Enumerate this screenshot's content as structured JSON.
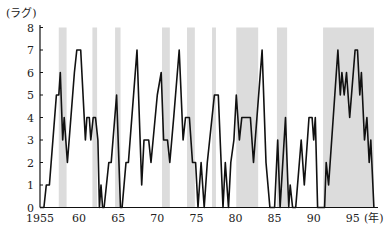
{
  "chart_data": {
    "type": "line",
    "title": "",
    "ylabel": "(ラグ)",
    "xlabel": "(年)",
    "xlim": [
      1955,
      1998.5
    ],
    "ylim": [
      0,
      8
    ],
    "grid": false,
    "legend": null,
    "x_ticks": [
      1955,
      1960,
      1965,
      1970,
      1975,
      1980,
      1985,
      1990,
      1995
    ],
    "x_tick_labels": [
      "1955",
      "60",
      "65",
      "70",
      "75",
      "80",
      "85",
      "90",
      "95"
    ],
    "y_ticks": [
      0,
      1,
      2,
      3,
      4,
      5,
      6,
      7,
      8
    ],
    "y_tick_labels": [
      "0",
      "1",
      "2",
      "3",
      "4",
      "5",
      "6",
      "7",
      "8"
    ],
    "shaded_periods": [
      [
        1957.4,
        1958.4
      ],
      [
        1961.7,
        1962.3
      ],
      [
        1964.6,
        1965.3
      ],
      [
        1970.6,
        1971.6
      ],
      [
        1973.8,
        1974.8
      ],
      [
        1977.0,
        1977.5
      ],
      [
        1980.1,
        1982.9
      ],
      [
        1985.3,
        1986.6
      ],
      [
        1991.2,
        1997.7
      ]
    ],
    "shade_color": "#dcdcdc",
    "line_color": "#111111",
    "series": [
      {
        "name": "lag",
        "points": [
          [
            1955.0,
            0
          ],
          [
            1955.5,
            0
          ],
          [
            1955.8,
            1
          ],
          [
            1956.2,
            1
          ],
          [
            1957.1,
            5
          ],
          [
            1957.4,
            5
          ],
          [
            1957.6,
            6
          ],
          [
            1957.9,
            3
          ],
          [
            1958.1,
            4
          ],
          [
            1958.5,
            2
          ],
          [
            1959.4,
            6
          ],
          [
            1959.7,
            7
          ],
          [
            1960.2,
            7
          ],
          [
            1960.8,
            3
          ],
          [
            1961.0,
            4
          ],
          [
            1961.3,
            4
          ],
          [
            1961.5,
            3
          ],
          [
            1961.8,
            4
          ],
          [
            1962.1,
            4
          ],
          [
            1962.4,
            3
          ],
          [
            1962.6,
            0
          ],
          [
            1962.8,
            1
          ],
          [
            1963.0,
            0
          ],
          [
            1963.2,
            0
          ],
          [
            1963.8,
            2
          ],
          [
            1964.1,
            2
          ],
          [
            1964.8,
            5
          ],
          [
            1965.3,
            0
          ],
          [
            1965.5,
            0
          ],
          [
            1966.0,
            2
          ],
          [
            1966.3,
            2
          ],
          [
            1967.4,
            7
          ],
          [
            1968.0,
            1
          ],
          [
            1968.3,
            3
          ],
          [
            1968.9,
            3
          ],
          [
            1969.2,
            2
          ],
          [
            1970.0,
            5
          ],
          [
            1970.5,
            6
          ],
          [
            1970.8,
            3
          ],
          [
            1971.3,
            3
          ],
          [
            1971.6,
            2
          ],
          [
            1972.1,
            4
          ],
          [
            1972.8,
            7
          ],
          [
            1973.3,
            3
          ],
          [
            1973.6,
            4
          ],
          [
            1974.1,
            4
          ],
          [
            1974.5,
            2
          ],
          [
            1974.9,
            2
          ],
          [
            1975.2,
            0
          ],
          [
            1975.6,
            2
          ],
          [
            1976.0,
            0
          ],
          [
            1976.4,
            2
          ],
          [
            1977.3,
            5
          ],
          [
            1977.8,
            5
          ],
          [
            1978.4,
            0
          ],
          [
            1978.7,
            2
          ],
          [
            1979.1,
            0
          ],
          [
            1979.4,
            2
          ],
          [
            1979.8,
            3
          ],
          [
            1980.1,
            5
          ],
          [
            1980.5,
            3
          ],
          [
            1980.8,
            4
          ],
          [
            1981.9,
            4
          ],
          [
            1982.3,
            2
          ],
          [
            1983.4,
            7
          ],
          [
            1983.9,
            2
          ],
          [
            1984.4,
            0
          ],
          [
            1985.0,
            0
          ],
          [
            1985.4,
            3
          ],
          [
            1985.7,
            0
          ],
          [
            1986.4,
            4
          ],
          [
            1986.8,
            0
          ],
          [
            1987.0,
            1
          ],
          [
            1987.3,
            0
          ],
          [
            1987.7,
            0
          ],
          [
            1988.4,
            3
          ],
          [
            1988.8,
            1
          ],
          [
            1989.4,
            4
          ],
          [
            1989.8,
            4
          ],
          [
            1990.0,
            3
          ],
          [
            1990.2,
            4
          ],
          [
            1990.5,
            0
          ],
          [
            1991.4,
            0
          ],
          [
            1991.6,
            2
          ],
          [
            1991.9,
            1
          ],
          [
            1993.1,
            7
          ],
          [
            1993.4,
            5
          ],
          [
            1993.6,
            6
          ],
          [
            1993.9,
            5
          ],
          [
            1994.2,
            6
          ],
          [
            1994.6,
            4
          ],
          [
            1995.3,
            7
          ],
          [
            1995.6,
            7
          ],
          [
            1995.9,
            5
          ],
          [
            1996.1,
            6
          ],
          [
            1996.5,
            3
          ],
          [
            1996.8,
            4
          ],
          [
            1997.1,
            2
          ],
          [
            1997.3,
            3
          ],
          [
            1997.7,
            0
          ]
        ]
      }
    ]
  }
}
